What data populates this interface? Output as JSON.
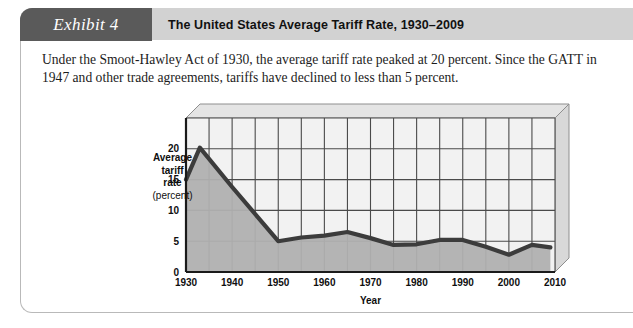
{
  "exhibit": {
    "tab_label": "Exhibit 4",
    "title": "The United States Average Tariff Rate, 1930–2009",
    "caption": "Under the Smoot-Hawley Act of 1930, the average tariff rate peaked at 20 percent. Since the GATT in 1947 and other trade agreements, tariffs have declined to less than 5 percent."
  },
  "colors": {
    "tab_background": "#5a5a5a",
    "header_background": "#d2d2d2",
    "frame_border": "#b9b9b9",
    "plot_background": "#f2f2f2",
    "area_fill": "#b0b0b0",
    "line": "#3c3c3c",
    "gridline": "#4a4a4a",
    "wall_side": "#d8d8d8",
    "wall_top": "#e4e4e4"
  },
  "chart_data": {
    "type": "area",
    "title": "The United States Average Tariff Rate, 1930–2009",
    "xlabel": "Year",
    "ylabel": "Average tariff rate (percent)",
    "ylabel_lines": [
      "Average",
      "tariff",
      "rate",
      "(percent)"
    ],
    "xlim": [
      1930,
      2010
    ],
    "ylim": [
      0,
      25
    ],
    "xticks": [
      1930,
      1940,
      1950,
      1960,
      1970,
      1980,
      1990,
      2000,
      2010
    ],
    "xtick_labels": [
      "1930",
      "1940",
      "1950",
      "1960",
      "1970",
      "1980",
      "1990",
      "2000",
      "2010"
    ],
    "yticks": [
      0,
      5,
      10,
      15,
      20
    ],
    "ytick_labels": [
      "0",
      "5",
      "10",
      "15",
      "20"
    ],
    "y_gridlines": [
      5,
      10,
      15,
      20,
      25
    ],
    "x_gridlines": [
      1935,
      1940,
      1945,
      1950,
      1955,
      1960,
      1965,
      1970,
      1975,
      1980,
      1985,
      1990,
      1995,
      2000,
      2005,
      2010
    ],
    "grid": true,
    "legend": "none",
    "series": [
      {
        "name": "Average tariff rate (percent)",
        "x": [
          1930,
          1933,
          1940,
          1950,
          1955,
          1960,
          1965,
          1970,
          1975,
          1980,
          1985,
          1990,
          1995,
          2000,
          2005,
          2009
        ],
        "values": [
          15.0,
          20.2,
          13.8,
          5.0,
          5.6,
          5.9,
          6.5,
          5.5,
          4.4,
          4.5,
          5.2,
          5.2,
          4.1,
          2.8,
          4.4,
          4.0
        ]
      }
    ],
    "annotations": [
      "Peak of 20 percent under the Smoot-Hawley Act of 1930",
      "Declined to less than 5 percent after GATT (1947)"
    ]
  }
}
